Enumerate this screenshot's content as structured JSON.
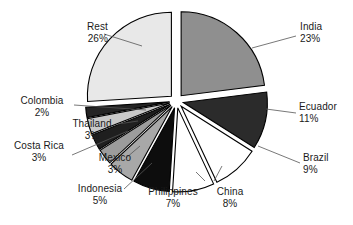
{
  "chart_data": {
    "type": "pie",
    "title": "",
    "xlabel": "",
    "ylabel": "",
    "legend_position": "none",
    "grid": false,
    "units": "percent",
    "total": 100,
    "exploded": true,
    "categories": [
      "India",
      "Ecuador",
      "Brazil",
      "China",
      "Philippines",
      "Indonesia",
      "Mexico",
      "Costa Rica",
      "Thailand",
      "Colombia",
      "Rest"
    ],
    "values": [
      23,
      11,
      9,
      8,
      7,
      5,
      3,
      3,
      3,
      2,
      26
    ],
    "labels": [
      "23%",
      "11%",
      "9%",
      "8%",
      "7%",
      "5%",
      "3%",
      "3%",
      "3%",
      "2%",
      "26%"
    ],
    "colors": [
      "#8f8f8f",
      "#2b2b2b",
      "#ffffff",
      "#ffffff",
      "#0d0d0d",
      "#a8a8a8",
      "#9c9c9c",
      "#1f1f1f",
      "#c9c9c9",
      "#242424",
      "#e8e8e8"
    ],
    "slices": [
      {
        "name": "India",
        "value": 23,
        "label": "23%",
        "color": "#8f8f8f"
      },
      {
        "name": "Ecuador",
        "value": 11,
        "label": "11%",
        "color": "#2b2b2b"
      },
      {
        "name": "Brazil",
        "value": 9,
        "label": "9%",
        "color": "#ffffff"
      },
      {
        "name": "China",
        "value": 8,
        "label": "8%",
        "color": "#ffffff"
      },
      {
        "name": "Philippines",
        "value": 7,
        "label": "7%",
        "color": "#0d0d0d"
      },
      {
        "name": "Indonesia",
        "value": 5,
        "label": "5%",
        "color": "#a8a8a8"
      },
      {
        "name": "Mexico",
        "value": 3,
        "label": "3%",
        "color": "#9c9c9c"
      },
      {
        "name": "Costa Rica",
        "value": 3,
        "label": "3%",
        "color": "#1f1f1f"
      },
      {
        "name": "Thailand",
        "value": 3,
        "label": "3%",
        "color": "#c9c9c9"
      },
      {
        "name": "Colombia",
        "value": 2,
        "label": "2%",
        "color": "#242424"
      },
      {
        "name": "Rest",
        "value": 26,
        "label": "26%",
        "color": "#e8e8e8"
      }
    ]
  },
  "labels": {
    "india": {
      "name": "India",
      "pct": "23%"
    },
    "ecuador": {
      "name": "Ecuador",
      "pct": "11%"
    },
    "brazil": {
      "name": "Brazil",
      "pct": "9%"
    },
    "china": {
      "name": "China",
      "pct": "8%"
    },
    "philippines": {
      "name": "Philippines",
      "pct": "7%"
    },
    "indonesia": {
      "name": "Indonesia",
      "pct": "5%"
    },
    "mexico": {
      "name": "Mexico",
      "pct": "3%"
    },
    "costa_rica": {
      "name": "Costa Rica",
      "pct": "3%"
    },
    "thailand": {
      "name": "Thailand",
      "pct": "3%"
    },
    "colombia": {
      "name": "Colombia",
      "pct": "2%"
    },
    "rest": {
      "name": "Rest",
      "pct": "26%"
    }
  },
  "style": {
    "background": "#ffffff",
    "outline": "#000000",
    "leader": "#555555",
    "text": "#1a1a1a"
  }
}
